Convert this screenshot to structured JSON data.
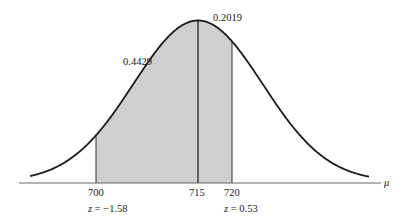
{
  "chart_data": {
    "type": "area",
    "title": "",
    "xlabel": "μ",
    "ylabel": "",
    "mean": 715,
    "shade_from": 700,
    "shade_to": 720,
    "x_ticks": [
      {
        "value": 700,
        "label": "700"
      },
      {
        "value": 715,
        "label": "715"
      },
      {
        "value": 720,
        "label": "720"
      }
    ],
    "z_labels": [
      {
        "value": 700,
        "label": "z = −1.58"
      },
      {
        "value": 720,
        "label": "z = 0.53"
      }
    ],
    "area_labels": [
      {
        "region": "700-715",
        "label": "0.4429"
      },
      {
        "region": "715-720",
        "label": "0.2019"
      }
    ],
    "colors": {
      "curve": "#1a1a1a",
      "shade": "#cfcfcf",
      "axis": "#555555"
    },
    "grid": false,
    "legend": null
  },
  "labels": {
    "axis_symbol": "μ",
    "tick_700": "700",
    "tick_715": "715",
    "tick_720": "720",
    "z_left": "z = −1.58",
    "z_right": "z = 0.53",
    "area_left": "0.4429",
    "area_right": "0.2019"
  }
}
